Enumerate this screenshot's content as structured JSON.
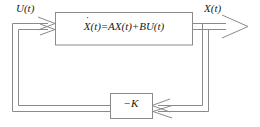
{
  "diagram": {
    "type": "control-system-block-diagram",
    "stroke_color": "#808080",
    "text_color": "#1a1a1a",
    "background_color": "#ffffff",
    "labels": {
      "input_signal": "U(t)",
      "output_signal": "X(t)",
      "gain_block": "−K"
    },
    "plant_block": {
      "equation_parts": {
        "state_var": "X",
        "state_arg": "(t)",
        "equals": "=",
        "term_a": "AX",
        "term_a_arg": "(t)",
        "plus": "+",
        "term_b": "BU",
        "term_b_arg": "(t)",
        "derivative_dot": "˙"
      },
      "equation_text": "Ẋ(t) = AX(t) + BU(t)"
    },
    "connections": [
      {
        "name": "input-to-plant",
        "style": "double-line-with-double-arrowhead"
      },
      {
        "name": "plant-to-output",
        "style": "double-line-with-arrowhead"
      },
      {
        "name": "output-to-gain-feedback",
        "style": "double-line-with-double-arrowhead"
      },
      {
        "name": "gain-to-input-summing",
        "style": "double-line"
      }
    ]
  }
}
